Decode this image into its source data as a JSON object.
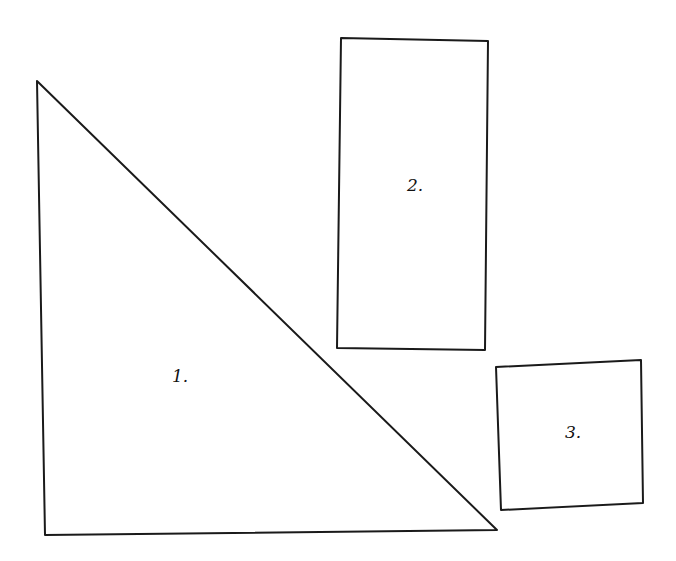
{
  "canvas": {
    "width": 676,
    "height": 561,
    "background": "#ffffff",
    "stroke_color": "#1a1a1a"
  },
  "shapes": [
    {
      "id": "1",
      "type": "right-triangle",
      "label": "1.",
      "points": "37,81 45,535 497,530",
      "label_pos": {
        "x": 172,
        "y": 382
      }
    },
    {
      "id": "2",
      "type": "rectangle",
      "label": "2.",
      "points": "341,38 488,41 485,350 337,348",
      "label_pos": {
        "x": 407,
        "y": 191
      }
    },
    {
      "id": "3",
      "type": "square",
      "label": "3.",
      "points": "496,367 641,360 643,503 501,510",
      "label_pos": {
        "x": 565,
        "y": 438
      }
    }
  ]
}
